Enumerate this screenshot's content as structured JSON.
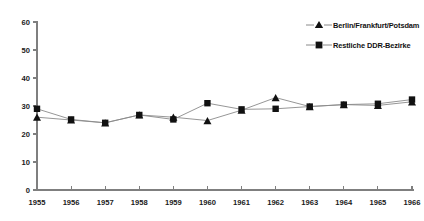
{
  "chart_data": {
    "type": "line",
    "title": "",
    "subtitle": "",
    "xlabel": "",
    "ylabel": "",
    "xlim": [
      1955,
      1966
    ],
    "ylim": [
      0,
      60
    ],
    "yticks": [
      0,
      10,
      20,
      30,
      40,
      50,
      60
    ],
    "grid": false,
    "legend_position": "top-right",
    "categories": [
      "1955",
      "1956",
      "1957",
      "1958",
      "1959",
      "1960",
      "1961",
      "1962",
      "1963",
      "1964",
      "1965",
      "1966"
    ],
    "x": [
      1955,
      1956,
      1957,
      1958,
      1959,
      1960,
      1961,
      1962,
      1963,
      1964,
      1965,
      1966
    ],
    "series": [
      {
        "name": "Berlin/Frankfurt/Potsdam",
        "marker": "triangle",
        "color": "#111111",
        "values": [
          26.0,
          25.0,
          24.0,
          26.8,
          26.0,
          24.8,
          28.5,
          33.0,
          29.8,
          30.5,
          30.2,
          31.5
        ]
      },
      {
        "name": "Restliche DDR-Bezirke",
        "marker": "square",
        "color": "#111111",
        "values": [
          29.0,
          25.2,
          24.0,
          26.8,
          25.2,
          31.0,
          28.8,
          29.0,
          29.8,
          30.5,
          30.8,
          32.3
        ]
      }
    ]
  },
  "axis": {
    "y_tick_labels": [
      "0",
      "10",
      "20",
      "30",
      "40",
      "50",
      "60"
    ],
    "x_tick_labels": [
      "1955",
      "1956",
      "1957",
      "1958",
      "1959",
      "1960",
      "1961",
      "1962",
      "1963",
      "1964",
      "1965",
      "1966"
    ]
  },
  "legend": {
    "items": [
      {
        "label": "Berlin/Frankfurt/Potsdam",
        "marker": "triangle-marker"
      },
      {
        "label": "Restliche DDR-Bezirke",
        "marker": "square-marker"
      }
    ]
  }
}
